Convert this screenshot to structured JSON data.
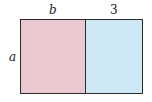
{
  "diagram": {
    "type": "area-model rectangle",
    "labels": {
      "left_width": "b",
      "right_width": "3",
      "height": "a"
    },
    "regions": [
      {
        "name": "left",
        "color": "#ebc7cf"
      },
      {
        "name": "right",
        "color": "#cde7f5"
      }
    ]
  }
}
